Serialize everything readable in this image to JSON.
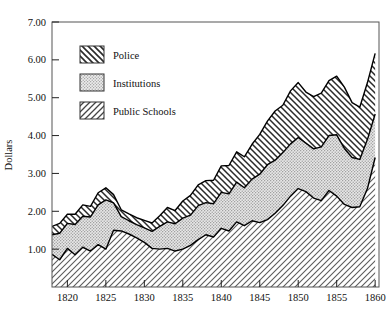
{
  "chart_data": {
    "type": "area",
    "stacked": true,
    "title": "",
    "xlabel": "",
    "ylabel": "Dollars",
    "xlim": [
      1818,
      1860.5
    ],
    "ylim": [
      0,
      7
    ],
    "grid": false,
    "legend_position": "top-left inside plot",
    "xticks": [
      1820,
      1825,
      1830,
      1835,
      1840,
      1845,
      1850,
      1855,
      1860
    ],
    "xtick_labels": [
      "1820",
      "1825",
      "1830",
      "1835",
      "1840",
      "1845",
      "1850",
      "1855",
      "1860"
    ],
    "yticks": [
      1,
      2,
      3,
      4,
      5,
      6,
      7
    ],
    "ytick_labels": [
      "1.00",
      "2.00",
      "3.00",
      "4.00",
      "5.00",
      "6.00",
      "7.00"
    ],
    "x": [
      1818,
      1819,
      1820,
      1821,
      1822,
      1823,
      1824,
      1825,
      1826,
      1827,
      1828,
      1829,
      1830,
      1831,
      1832,
      1833,
      1834,
      1835,
      1836,
      1837,
      1838,
      1839,
      1840,
      1841,
      1842,
      1843,
      1844,
      1845,
      1846,
      1847,
      1848,
      1849,
      1850,
      1851,
      1852,
      1853,
      1854,
      1855,
      1856,
      1857,
      1858,
      1859,
      1860
    ],
    "series": [
      {
        "name": "Public Schools",
        "pattern": "diagonal-hatch-forward",
        "values": [
          0.86,
          0.72,
          1.02,
          0.85,
          1.05,
          0.95,
          1.12,
          1.0,
          1.5,
          1.48,
          1.4,
          1.3,
          1.18,
          1.02,
          1.0,
          1.02,
          0.95,
          1.0,
          1.1,
          1.25,
          1.38,
          1.32,
          1.55,
          1.48,
          1.72,
          1.62,
          1.75,
          1.7,
          1.78,
          1.95,
          2.15,
          2.4,
          2.6,
          2.52,
          2.35,
          2.28,
          2.55,
          2.4,
          2.18,
          2.1,
          2.12,
          2.6,
          3.42
        ]
      },
      {
        "name": "Institutions",
        "pattern": "stipple-dots",
        "values": [
          0.52,
          0.7,
          0.66,
          0.8,
          0.82,
          0.9,
          1.05,
          1.3,
          0.72,
          0.38,
          0.35,
          0.35,
          0.38,
          0.45,
          0.6,
          0.7,
          0.72,
          0.82,
          0.8,
          0.9,
          0.85,
          0.88,
          0.95,
          0.98,
          1.05,
          1.0,
          1.1,
          1.28,
          1.45,
          1.4,
          1.4,
          1.38,
          1.35,
          1.28,
          1.3,
          1.42,
          1.45,
          1.62,
          1.48,
          1.32,
          1.25,
          1.3,
          1.15
        ]
      },
      {
        "name": "Police",
        "pattern": "diagonal-hatch-back",
        "values": [
          0.22,
          0.26,
          0.24,
          0.27,
          0.3,
          0.28,
          0.32,
          0.32,
          0.22,
          0.18,
          0.18,
          0.18,
          0.2,
          0.22,
          0.28,
          0.38,
          0.35,
          0.45,
          0.52,
          0.55,
          0.58,
          0.62,
          0.7,
          0.75,
          0.8,
          0.82,
          0.92,
          1.05,
          1.15,
          1.3,
          1.25,
          1.4,
          1.45,
          1.35,
          1.38,
          1.42,
          1.45,
          1.55,
          1.62,
          1.45,
          1.38,
          1.5,
          1.6
        ]
      }
    ],
    "totals": [
      1.6,
      1.68,
      1.92,
      1.92,
      2.17,
      2.13,
      2.49,
      2.62,
      2.44,
      2.04,
      1.93,
      1.83,
      1.76,
      1.69,
      1.88,
      2.1,
      2.02,
      2.27,
      2.42,
      2.7,
      2.81,
      2.82,
      3.2,
      3.21,
      3.57,
      3.44,
      3.77,
      4.03,
      4.38,
      4.65,
      4.8,
      5.18,
      5.4,
      5.15,
      5.03,
      5.12,
      5.45,
      5.57,
      5.28,
      4.87,
      4.75,
      5.4,
      6.17
    ]
  },
  "legend": {
    "items": [
      {
        "label": "Police"
      },
      {
        "label": "Institutions"
      },
      {
        "label": "Public Schools"
      }
    ]
  },
  "axes": {
    "ylabel": "Dollars"
  },
  "colors": {
    "ink": "#111111",
    "frame": "#555555",
    "background": "#ffffff",
    "institutions_fill": "#e2e2e2"
  }
}
